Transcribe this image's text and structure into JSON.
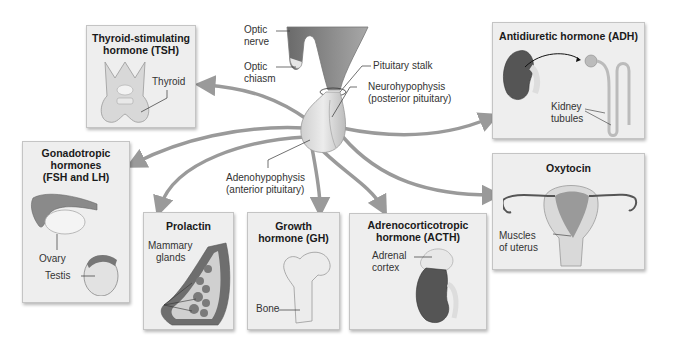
{
  "pituitary": {
    "optic_nerve": [
      "Optic",
      "nerve"
    ],
    "optic_chiasm": [
      "Optic",
      "chiasm"
    ],
    "pituitary_stalk": "Pituitary stalk",
    "neurohypophysis": [
      "Neurohypophysis",
      "(posterior pituitary)"
    ],
    "adenohypophysis": [
      "Adenohypophysis",
      "(anterior pituitary)"
    ]
  },
  "hormones": {
    "tsh": {
      "title": [
        "Thyroid-stimulating",
        "hormone (TSH)"
      ],
      "target_label": "Thyroid"
    },
    "gonadotropic": {
      "title": [
        "Gonadotropic",
        "hormones",
        "(FSH and LH)"
      ],
      "target_labels": [
        "Ovary",
        "Testis"
      ]
    },
    "prolactin": {
      "title": [
        "Prolactin"
      ],
      "target_label": [
        "Mammary",
        "glands"
      ]
    },
    "gh": {
      "title": [
        "Growth",
        "hormone (GH)"
      ],
      "target_label": "Bone"
    },
    "acth": {
      "title": [
        "Adrenocorticotropic",
        "hormone (ACTH)"
      ],
      "target_label": [
        "Adrenal",
        "cortex"
      ]
    },
    "adh": {
      "title": [
        "Antidiuretic hormone (ADH)"
      ],
      "target_label": [
        "Kidney",
        "tubules"
      ]
    },
    "oxytocin": {
      "title": [
        "Oxytocin"
      ],
      "target_label": [
        "Muscles",
        "of uterus"
      ]
    }
  },
  "colors": {
    "arrow": "#9a9a9a",
    "box_bg": "#eeeeee",
    "box_border": "#c4c4c4",
    "kidney": "#555555",
    "tissue": "#d9d9d9"
  }
}
